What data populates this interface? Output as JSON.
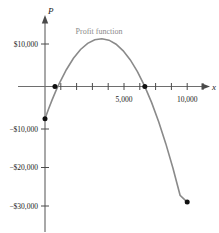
{
  "chart_data": {
    "type": "line",
    "title": "",
    "annotation": "Profit function",
    "xlabel": "x",
    "ylabel": "P",
    "xlim": [
      -900,
      11200
    ],
    "ylim": [
      -33500,
      13500
    ],
    "grid": false,
    "legend_position": "none",
    "x_ticks": [
      1000,
      2000,
      3000,
      4000,
      5000,
      6000,
      7000,
      8000,
      9000,
      10000
    ],
    "x_tick_labels": [
      "",
      "",
      "",
      "",
      "5,000",
      "",
      "",
      "",
      "",
      "10,000"
    ],
    "y_ticks": [
      10000,
      -10000,
      -20000,
      -30000
    ],
    "y_tick_labels": [
      "$10,000",
      "−$10,000",
      "−$20,000",
      "−$30,000"
    ],
    "series": [
      {
        "name": "Profit function",
        "color": "#8a8a8a",
        "x": [
          0,
          250,
          500,
          750,
          1000,
          1500,
          2000,
          2500,
          3000,
          3500,
          4000,
          4500,
          5000,
          5500,
          6000,
          6500,
          7000,
          7500,
          8000,
          8500,
          9000,
          9500,
          10000
        ],
        "y": [
          -7600,
          -5300,
          -3150,
          -1150,
          700,
          3950,
          6650,
          8700,
          10150,
          11000,
          11250,
          10900,
          9950,
          8400,
          6250,
          3500,
          150,
          -3800,
          -8350,
          -13500,
          -19250,
          -25600,
          -27200
        ]
      }
    ],
    "marked_points": [
      {
        "name": "y-intercept",
        "x": 0,
        "y": -7600
      },
      {
        "name": "left-x-intercept",
        "x": 700,
        "y": 0
      },
      {
        "name": "right-x-intercept",
        "x": 7020,
        "y": 0
      },
      {
        "name": "right-endpoint",
        "x": 10000,
        "y": -27200
      }
    ]
  },
  "colors": {
    "curve": "#8a8a8a",
    "axis": "#6e6e6e",
    "point": "#111111",
    "text": "#1a1a1a",
    "annotation": "#8a8a8a"
  }
}
